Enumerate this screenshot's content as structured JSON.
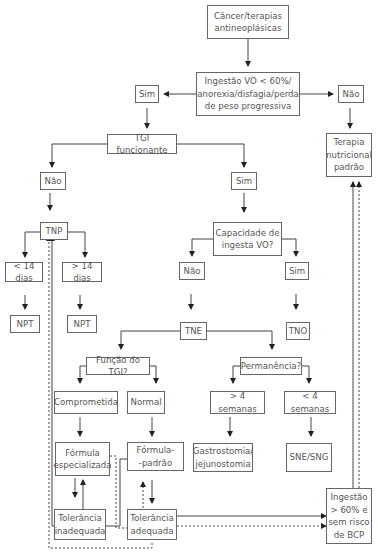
{
  "diagram": {
    "nodes": {
      "start": "Câncer/terapias\nantineoplásicas",
      "intake_question": "Ingestão VO < 60%/\nanorexia/disfagia/perda\nde peso progressiva",
      "yes_top": "Sim",
      "no_top": "Não",
      "standard_therapy": "Terapia\nnutricional\npadrão",
      "tgi": "TGI funcionante",
      "tgi_no": "Não",
      "tgi_yes": "Sim",
      "tnp": "TNP",
      "less_14": "< 14 dias",
      "more_14": "> 14 dias",
      "npt_left": "NPT",
      "npt_right": "NPT",
      "oral_capacity": "Capacidade de\ningesta VO?",
      "oral_no": "Não",
      "oral_yes": "Sim",
      "tne": "TNE",
      "tno": "TNO",
      "tgi_function": "Função do TGI?",
      "duration": "Permanência?",
      "compromised": "Comprometida",
      "normal": "Normal",
      "more_4_weeks": "> 4 semanas",
      "less_4_weeks": "< 4 semanas",
      "specialized_formula": "Fórmula\nespecializada",
      "standard_formula": "Fórmula-\n-padrão",
      "gastrostomy": "Gastrostomia/\njejunostomia",
      "sne_sng": "SNE/SNG",
      "inadequate_tolerance": "Tolerância\ninadequada",
      "adequate_tolerance": "Tolerância\nadequada",
      "intake_ok": "Ingestão\n> 60% e\nsem risco\nde BCP"
    },
    "colors": {
      "line": "#444444",
      "border": "#666666",
      "text": "#555555"
    }
  }
}
